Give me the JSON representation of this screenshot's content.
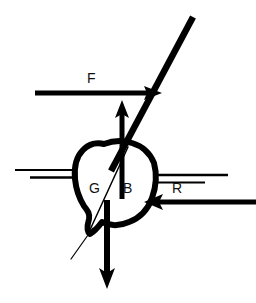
{
  "figure": {
    "type": "diagram",
    "background_color": "#ffffff",
    "stroke_color": "#000000",
    "width": 256,
    "height": 303
  },
  "labels": [
    {
      "id": "F",
      "text": "F",
      "meaning": "applied-force",
      "x": 90,
      "y": 72
    },
    {
      "id": "G",
      "text": "G",
      "meaning": "centre-of-gravity",
      "x": 90,
      "y": 181
    },
    {
      "id": "B",
      "text": "B",
      "meaning": "centre-of-buoyancy",
      "x": 122,
      "y": 181
    },
    {
      "id": "R",
      "text": "R",
      "meaning": "reaction-force",
      "x": 172,
      "y": 181
    }
  ],
  "arrows": [
    {
      "name": "force-arrow-F",
      "label": "F",
      "direction": "right",
      "x1": 35,
      "y1": 93,
      "x2": 160,
      "y2": 93,
      "stroke_width": 5
    },
    {
      "name": "reaction-arrow-R",
      "label": "R",
      "direction": "left",
      "x1": 253,
      "y1": 202,
      "x2": 146,
      "y2": 202,
      "stroke_width": 5
    },
    {
      "name": "buoyancy-arrow-up",
      "label": "B",
      "direction": "up",
      "x1": 122,
      "y1": 198,
      "x2": 122,
      "y2": 101,
      "stroke_width": 5
    },
    {
      "name": "weight-arrow-down",
      "label": "G",
      "direction": "down",
      "x1": 107,
      "y1": 200,
      "x2": 107,
      "y2": 288,
      "stroke_width": 6
    }
  ],
  "lines": [
    {
      "name": "mast-line",
      "description": "inclined mast / heel axis",
      "x1": 193,
      "y1": 17,
      "x2": 110,
      "y2": 172,
      "stroke_width": 6
    },
    {
      "name": "waterline-left-upper",
      "x1": 15,
      "y1": 170,
      "x2": 80,
      "y2": 170,
      "stroke_width": 1.6
    },
    {
      "name": "waterline-left-lower",
      "x1": 30,
      "y1": 177,
      "x2": 80,
      "y2": 177,
      "stroke_width": 2.2
    },
    {
      "name": "waterline-right-upper",
      "x1": 150,
      "y1": 175,
      "x2": 228,
      "y2": 175,
      "stroke_width": 2.4
    },
    {
      "name": "waterline-right-lower",
      "x1": 150,
      "y1": 182,
      "x2": 205,
      "y2": 182,
      "stroke_width": 2.0
    },
    {
      "name": "gb-reference-line",
      "description": "thin line through G to keel point",
      "x1": 127,
      "y1": 148,
      "x2": 88,
      "y2": 231,
      "stroke_width": 1.4
    },
    {
      "name": "keel-extension-line",
      "description": "thin line extending below keel point",
      "x1": 92,
      "y1": 228,
      "x2": 71,
      "y2": 259,
      "stroke_width": 1.2
    }
  ],
  "shapes": [
    {
      "name": "hull-cross-section",
      "description": "heeled ship hull section outline",
      "stroke_width": 6,
      "fill": "#ffffff",
      "path": "M 103 144 L 124 142 L 140 146 L 152 158 L 155 178 L 152 196 L 143 212 L 128 222 L 114 225 L 101 222 L 95 228 L 90 233 L 86 230 L 88 218 L 82 209 L 77 196 L 74 182 L 75 166 L 82 152 L 92 145 Z"
    }
  ]
}
